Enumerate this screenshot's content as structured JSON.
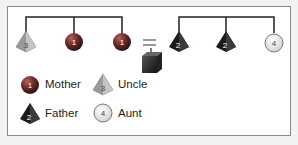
{
  "diagram": {
    "left_group": [
      {
        "shape": "pyramid",
        "color": "gray",
        "number": "3"
      },
      {
        "shape": "sphere",
        "color": "dark-red",
        "number": "1"
      },
      {
        "shape": "sphere",
        "color": "dark-red",
        "number": "1"
      }
    ],
    "equals": "=",
    "center_object": {
      "shape": "cube",
      "color": "black"
    },
    "right_group": [
      {
        "shape": "pyramid",
        "color": "black",
        "number": "2"
      },
      {
        "shape": "pyramid",
        "color": "black",
        "number": "2"
      },
      {
        "shape": "circle",
        "color": "light-gray",
        "number": "4"
      }
    ]
  },
  "legend": [
    {
      "shape": "sphere",
      "number": "1",
      "label": "Mother"
    },
    {
      "shape": "pyramid-gray",
      "number": "3",
      "label": "Uncle"
    },
    {
      "shape": "pyramid-black",
      "number": "2",
      "label": "Father"
    },
    {
      "shape": "circle",
      "number": "4",
      "label": "Aunt"
    }
  ]
}
